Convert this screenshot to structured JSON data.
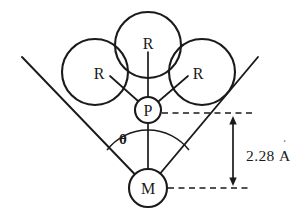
{
  "figure": {
    "background_color": "#ffffff",
    "line_color": "#1a1a1a"
  },
  "atoms": {
    "phosphorus": {
      "label": "P",
      "name": "phosphorus-atom"
    },
    "metal": {
      "label": "M",
      "name": "metal-atom"
    }
  },
  "substituents": [
    {
      "label": "R",
      "position": "top"
    },
    {
      "label": "R",
      "position": "left"
    },
    {
      "label": "R",
      "position": "right"
    }
  ],
  "annotations": {
    "angle_label": "θ",
    "distance_value": "2.28",
    "distance_unit": "A",
    "distance_unit_ring": "˚",
    "distance_full": "2.28 Å"
  }
}
